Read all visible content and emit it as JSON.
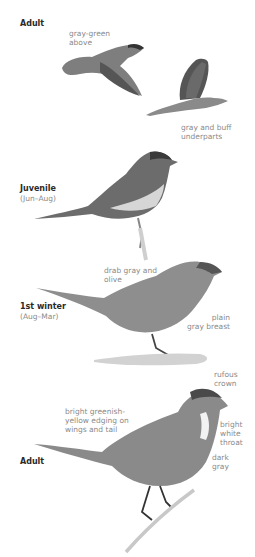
{
  "plate": {
    "sections": [
      {
        "heading": "Adult",
        "subheading": ""
      },
      {
        "heading": "Juvenile",
        "subheading": "(Jun–Aug)"
      },
      {
        "heading": "1st winter",
        "subheading": "(Aug–Mar)"
      },
      {
        "heading": "Adult",
        "subheading": ""
      }
    ],
    "annotations": {
      "flight_upper": "gray-green\nabove",
      "flight_lower": "gray and buff\nunderparts",
      "winter_back": "drab gray and\nolive",
      "winter_breast": "plain\ngray breast",
      "adult_crown": "rufous\ncrown",
      "adult_wing": "bright greenish-\nyellow edging on\nwings and tail",
      "adult_throat": "bright\nwhite\nthroat",
      "adult_belly": "dark\ngray"
    },
    "colors": {
      "background": "#ffffff",
      "heading_text": "#2a2a2a",
      "label_text": "#8a8a8a",
      "bird_body": "#8c8c8c",
      "bird_dark": "#4a4a4a",
      "bird_light": "#d8d8d8"
    }
  }
}
